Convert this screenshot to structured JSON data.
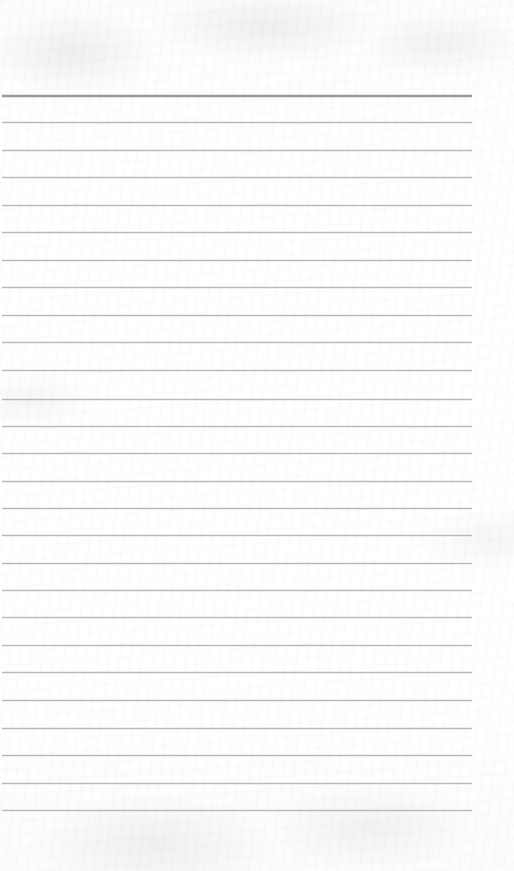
{
  "document": {
    "kind": "scanned-lined-notepad-page",
    "title": "Blank Lined Notepad Page",
    "content_text": "",
    "handwriting": "",
    "printed_text": "",
    "page_width": 514,
    "page_height": 871,
    "background_color": "#fefefe",
    "paper_tone": "#ffffff"
  },
  "ruling": {
    "line_count": 27,
    "line_color": "#b9b9bd",
    "first_line_color": "#9a9a9f",
    "line_thickness": 1,
    "first_line_thickness": 2,
    "line_spacing": 27.5,
    "first_line_y": 95,
    "last_line_y": 810,
    "line_left_x": 2,
    "line_right_x": 472,
    "line_width": 470,
    "top_margin": 95,
    "bottom_margin": 61,
    "right_margin": 42,
    "lines": [
      {
        "index": 1,
        "y": 95,
        "emphasis": "heavy"
      },
      {
        "index": 2,
        "y": 122,
        "emphasis": "normal"
      },
      {
        "index": 3,
        "y": 150,
        "emphasis": "normal"
      },
      {
        "index": 4,
        "y": 177,
        "emphasis": "normal"
      },
      {
        "index": 5,
        "y": 205,
        "emphasis": "normal"
      },
      {
        "index": 6,
        "y": 232,
        "emphasis": "normal"
      },
      {
        "index": 7,
        "y": 260,
        "emphasis": "normal"
      },
      {
        "index": 8,
        "y": 287,
        "emphasis": "normal"
      },
      {
        "index": 9,
        "y": 315,
        "emphasis": "normal"
      },
      {
        "index": 10,
        "y": 342,
        "emphasis": "normal"
      },
      {
        "index": 11,
        "y": 370,
        "emphasis": "normal"
      },
      {
        "index": 12,
        "y": 399,
        "emphasis": "normal"
      },
      {
        "index": 13,
        "y": 426,
        "emphasis": "normal"
      },
      {
        "index": 14,
        "y": 453,
        "emphasis": "normal"
      },
      {
        "index": 15,
        "y": 481,
        "emphasis": "normal"
      },
      {
        "index": 16,
        "y": 508,
        "emphasis": "normal"
      },
      {
        "index": 17,
        "y": 535,
        "emphasis": "normal"
      },
      {
        "index": 18,
        "y": 563,
        "emphasis": "normal"
      },
      {
        "index": 19,
        "y": 590,
        "emphasis": "normal"
      },
      {
        "index": 20,
        "y": 617,
        "emphasis": "normal"
      },
      {
        "index": 21,
        "y": 645,
        "emphasis": "normal"
      },
      {
        "index": 22,
        "y": 672,
        "emphasis": "normal"
      },
      {
        "index": 23,
        "y": 700,
        "emphasis": "normal"
      },
      {
        "index": 24,
        "y": 728,
        "emphasis": "normal"
      },
      {
        "index": 25,
        "y": 755,
        "emphasis": "normal"
      },
      {
        "index": 26,
        "y": 783,
        "emphasis": "normal"
      },
      {
        "index": 27,
        "y": 810,
        "emphasis": "normal"
      }
    ]
  }
}
